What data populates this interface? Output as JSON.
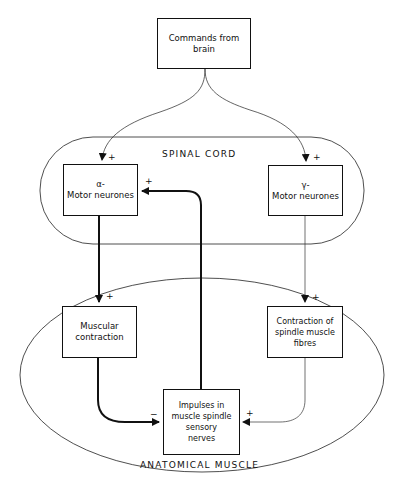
{
  "diagram": {
    "regions": {
      "spinal_cord": "SPINAL CORD",
      "anatomical_muscle": "ANATOMICAL MUSCLE"
    },
    "nodes": {
      "commands": {
        "line1": "Commands from",
        "line2": "brain"
      },
      "alpha": {
        "line1": "α-",
        "line2": "Motor neurones"
      },
      "gamma": {
        "line1": "γ-",
        "line2": "Motor neurones"
      },
      "muscular": {
        "line1": "Muscular",
        "line2": "contraction"
      },
      "spindle": {
        "line1": "Contraction of",
        "line2": "spindle muscle",
        "line3": "fibres"
      },
      "impulses": {
        "line1": "Impulses in",
        "line2": "muscle spindle",
        "line3": "sensory",
        "line4": "nerves"
      }
    },
    "edges": [
      {
        "from": "commands",
        "to": "alpha",
        "sign": "+"
      },
      {
        "from": "commands",
        "to": "gamma",
        "sign": "+"
      },
      {
        "from": "alpha",
        "to": "muscular",
        "sign": "+"
      },
      {
        "from": "gamma",
        "to": "spindle",
        "sign": "+"
      },
      {
        "from": "muscular",
        "to": "impulses",
        "sign": "−"
      },
      {
        "from": "spindle",
        "to": "impulses",
        "sign": "+"
      },
      {
        "from": "impulses",
        "to": "alpha",
        "sign": "+"
      }
    ],
    "signs": {
      "commands_alpha": "+",
      "commands_gamma": "+",
      "impulses_alpha": "+",
      "alpha_muscular": "+",
      "gamma_spindle": "+",
      "muscular_impulses": "−",
      "spindle_impulses": "+"
    }
  }
}
